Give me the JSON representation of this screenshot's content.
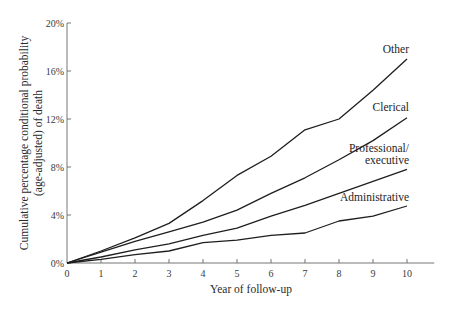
{
  "chart_data": {
    "type": "line",
    "title": "",
    "xlabel": "Year of follow-up",
    "ylabel": "Cumulative percentage conditional probability (age-adjusted) of death",
    "ylabel_lines": [
      "Cumulative percentage conditional probability",
      "(age-adjusted) of death"
    ],
    "x": [
      0,
      1,
      2,
      3,
      4,
      5,
      6,
      7,
      8,
      9,
      10
    ],
    "xlim": [
      0,
      10.8
    ],
    "ylim": [
      0,
      20
    ],
    "x_ticks": [
      "0",
      "1",
      "2",
      "3",
      "4",
      "5",
      "6",
      "7",
      "8",
      "9",
      "10"
    ],
    "y_ticks": [
      {
        "value": 0,
        "label": "0%"
      },
      {
        "value": 4,
        "label": "4%"
      },
      {
        "value": 8,
        "label": "8%"
      },
      {
        "value": 12,
        "label": "12%"
      },
      {
        "value": 16,
        "label": "16%"
      },
      {
        "value": 20,
        "label": "20%"
      }
    ],
    "grid": false,
    "legend": "inline labels at line ends",
    "series": [
      {
        "name": "Other",
        "label_lines": [
          "Other"
        ],
        "values": [
          0,
          1.0,
          2.1,
          3.3,
          5.2,
          7.3,
          8.9,
          11.1,
          12.0,
          14.4,
          17.0
        ]
      },
      {
        "name": "Clerical",
        "label_lines": [
          "Clerical"
        ],
        "values": [
          0,
          0.9,
          1.8,
          2.6,
          3.4,
          4.4,
          5.8,
          7.1,
          8.6,
          10.2,
          12.1
        ]
      },
      {
        "name": "Professional/executive",
        "label_lines": [
          "Professional/",
          "executive"
        ],
        "values": [
          0,
          0.5,
          1.1,
          1.6,
          2.3,
          2.9,
          3.9,
          4.8,
          5.8,
          6.8,
          7.8
        ]
      },
      {
        "name": "Administrative",
        "label_lines": [
          "Administrative"
        ],
        "values": [
          0,
          0.3,
          0.7,
          1.0,
          1.7,
          1.9,
          2.3,
          2.5,
          3.5,
          3.9,
          4.75
        ]
      }
    ]
  }
}
